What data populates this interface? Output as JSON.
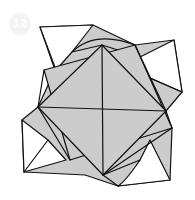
{
  "diagram": {
    "type": "origami-fold-diagram",
    "step_badge": "12",
    "colors": {
      "paper_colored": "#cccccc",
      "paper_white": "#ffffff",
      "stroke": "#111111",
      "badge": "#f3f3f3"
    }
  }
}
